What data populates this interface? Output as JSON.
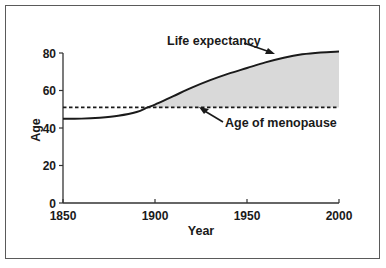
{
  "chart_data": {
    "type": "line",
    "title": "",
    "xlabel": "Year",
    "ylabel": "Age",
    "xlim": [
      1850,
      2000
    ],
    "ylim": [
      0,
      80
    ],
    "x_ticks": [
      "1850",
      "1900",
      "1950",
      "2000"
    ],
    "y_ticks": [
      "0",
      "20",
      "40",
      "60",
      "80"
    ],
    "grid": false,
    "legend": null,
    "series": [
      {
        "name": "Life expectancy",
        "x": [
          1850,
          1860,
          1870,
          1880,
          1890,
          1896,
          1900,
          1910,
          1920,
          1930,
          1940,
          1950,
          1960,
          1970,
          1980,
          1990,
          2000
        ],
        "values": [
          45,
          45,
          45.5,
          46.5,
          48.5,
          51,
          52.5,
          57,
          61.5,
          65.5,
          69,
          72,
          75,
          77.5,
          79.3,
          80.3,
          80.8
        ],
        "style": "solid"
      },
      {
        "name": "Age of menopause",
        "x": [
          1850,
          2000
        ],
        "values": [
          51,
          51
        ],
        "style": "dashed"
      }
    ],
    "shaded_region": {
      "between": [
        "Life expectancy",
        "Age of menopause"
      ],
      "from_x": 1896,
      "to_x": 2000,
      "color": "#d9d9d9"
    },
    "annotations": [
      {
        "text": "Life expectancy",
        "points_to": "Life expectancy",
        "arrow_target_x": 1945
      },
      {
        "text": "Age of menopause",
        "points_to": "Age of menopause",
        "arrow_target_x": 1912
      }
    ]
  },
  "colors": {
    "line": "#1a1a1a",
    "fill": "#d9d9d9",
    "frame": "#5a5a5a"
  }
}
